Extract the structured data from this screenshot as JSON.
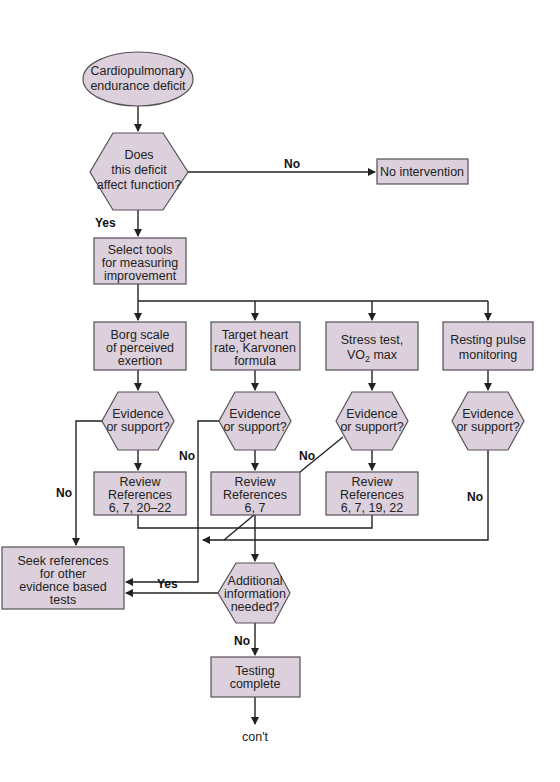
{
  "flowchart": {
    "start": {
      "lines": [
        "Cardiopulmonary",
        "endurance deficit"
      ]
    },
    "decision_function": {
      "lines": [
        "Does",
        "this deficit",
        "affect function?"
      ]
    },
    "no_intervention": {
      "lines": [
        "No intervention"
      ]
    },
    "select_tools": {
      "lines": [
        "Select tools",
        "for measuring",
        "improvement"
      ]
    },
    "tools": [
      {
        "lines": [
          "Borg scale",
          "of perceived",
          "exertion"
        ]
      },
      {
        "lines": [
          "Target heart",
          "rate, Karvonen",
          "formula"
        ]
      },
      {
        "lines": [
          "Stress test,"
        ],
        "line2_main": "VO",
        "line2_sub": "2",
        "line2_rest": " max"
      },
      {
        "lines": [
          "Resting pulse",
          "monitoring"
        ]
      }
    ],
    "evidence": {
      "lines": [
        "Evidence",
        "or support?"
      ]
    },
    "reviews": [
      {
        "lines": [
          "Review",
          "References",
          "6, 7, 20–22"
        ]
      },
      {
        "lines": [
          "Review",
          "References",
          "6, 7"
        ]
      },
      {
        "lines": [
          "Review",
          "References",
          "6, 7, 19, 22"
        ]
      }
    ],
    "seek_references": {
      "lines": [
        "Seek references",
        "for other",
        "evidence based",
        "tests"
      ]
    },
    "additional_info": {
      "lines": [
        "Additional",
        "information",
        "needed?"
      ]
    },
    "testing_complete": {
      "lines": [
        "Testing",
        "complete"
      ]
    },
    "continuation": "con't",
    "edge_labels": {
      "yes": "Yes",
      "no": "No"
    }
  },
  "colors": {
    "shape_fill": "#dcd0dc",
    "shape_stroke": "#555055",
    "line": "#222222"
  }
}
